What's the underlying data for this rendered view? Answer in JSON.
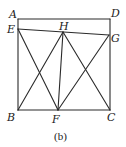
{
  "figure": {
    "caption": "(b)",
    "stroke_color": "#2a2a2a",
    "points": {
      "A": {
        "label": "A",
        "x": 18,
        "y": 19
      },
      "D": {
        "label": "D",
        "x": 110,
        "y": 19
      },
      "B": {
        "label": "B",
        "x": 18,
        "y": 110
      },
      "C": {
        "label": "C",
        "x": 110,
        "y": 110
      },
      "E": {
        "label": "E",
        "x": 18,
        "y": 29
      },
      "G": {
        "label": "G",
        "x": 109,
        "y": 35
      },
      "H": {
        "label": "H",
        "x": 63,
        "y": 32
      },
      "F": {
        "label": "F",
        "x": 58,
        "y": 110
      }
    },
    "segments": [
      [
        "A",
        "D"
      ],
      [
        "D",
        "C"
      ],
      [
        "C",
        "B"
      ],
      [
        "B",
        "A"
      ],
      [
        "E",
        "G"
      ],
      [
        "E",
        "F"
      ],
      [
        "B",
        "H"
      ],
      [
        "H",
        "F"
      ],
      [
        "H",
        "C"
      ],
      [
        "F",
        "G"
      ]
    ]
  }
}
